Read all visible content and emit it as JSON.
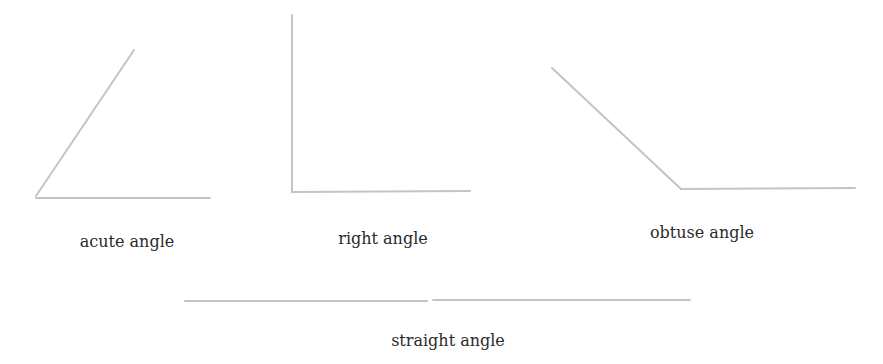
{
  "diagram": {
    "line_color": "#c4c4c4",
    "angles": [
      {
        "id": "acute",
        "label": "acute angle",
        "label_x": 127,
        "label_y": 232,
        "segments": [
          [
            36,
            196,
            134,
            50
          ],
          [
            36,
            198,
            210,
            198
          ]
        ]
      },
      {
        "id": "right",
        "label": "right angle",
        "label_x": 383,
        "label_y": 229,
        "segments": [
          [
            292,
            15,
            292,
            192
          ],
          [
            292,
            192,
            470,
            191
          ]
        ]
      },
      {
        "id": "obtuse",
        "label": "obtuse angle",
        "label_x": 702,
        "label_y": 223,
        "segments": [
          [
            552,
            68,
            681,
            189
          ],
          [
            681,
            189,
            855,
            188
          ]
        ]
      },
      {
        "id": "straight",
        "label": "straight angle",
        "label_x": 448,
        "label_y": 331,
        "segments": [
          [
            185,
            301,
            427,
            301
          ],
          [
            433,
            300,
            690,
            300
          ]
        ]
      }
    ]
  }
}
